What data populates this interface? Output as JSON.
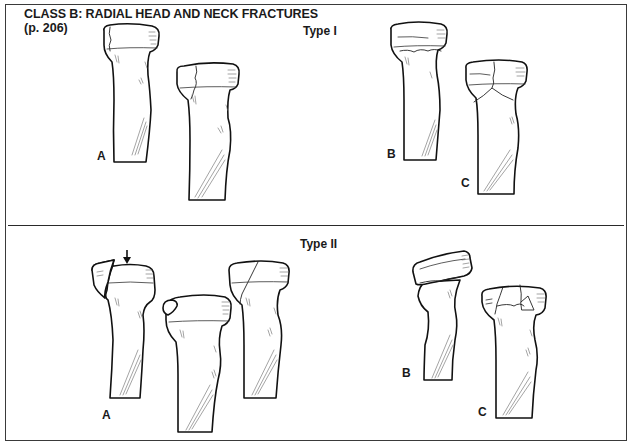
{
  "page": {
    "title": "CLASS B: RADIAL HEAD AND NECK FRACTURES",
    "page_ref": "(p. 206)"
  },
  "panels": [
    {
      "type_label": "Type I",
      "figures": [
        {
          "label": "A",
          "description": "Nondisplaced radial head fracture (two views)"
        },
        {
          "label": "B",
          "description": "Nondisplaced radial neck fracture"
        },
        {
          "label": "C",
          "description": "Nondisplaced fracture through head and neck"
        }
      ]
    },
    {
      "type_label": "Type II",
      "figures": [
        {
          "label": "A",
          "description": "Displaced marginal radial head fracture (three views, arrow indicating fragment)",
          "annotation": "arrow-down"
        },
        {
          "label": "B",
          "description": "Angulated radial neck fracture"
        },
        {
          "label": "C",
          "description": "Comminuted radial head fracture"
        }
      ]
    }
  ]
}
